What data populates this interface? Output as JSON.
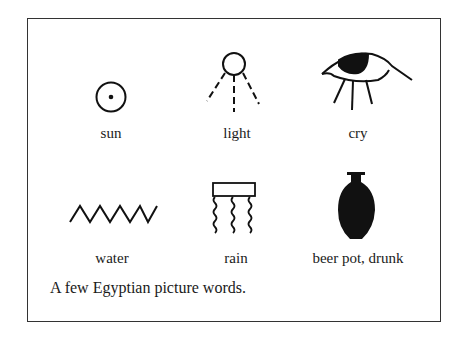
{
  "figure": {
    "caption": "A few Egyptian picture words.",
    "items": [
      {
        "label": "sun",
        "icon": "sun-glyph-icon"
      },
      {
        "label": "light",
        "icon": "light-glyph-icon"
      },
      {
        "label": "cry",
        "icon": "eye-tears-glyph-icon"
      },
      {
        "label": "water",
        "icon": "zigzag-water-glyph-icon"
      },
      {
        "label": "rain",
        "icon": "rain-glyph-icon"
      },
      {
        "label": "beer pot, drunk",
        "icon": "beer-pot-glyph-icon"
      }
    ],
    "colors": {
      "ink": "#111111",
      "border": "#333333",
      "background": "#ffffff"
    }
  }
}
